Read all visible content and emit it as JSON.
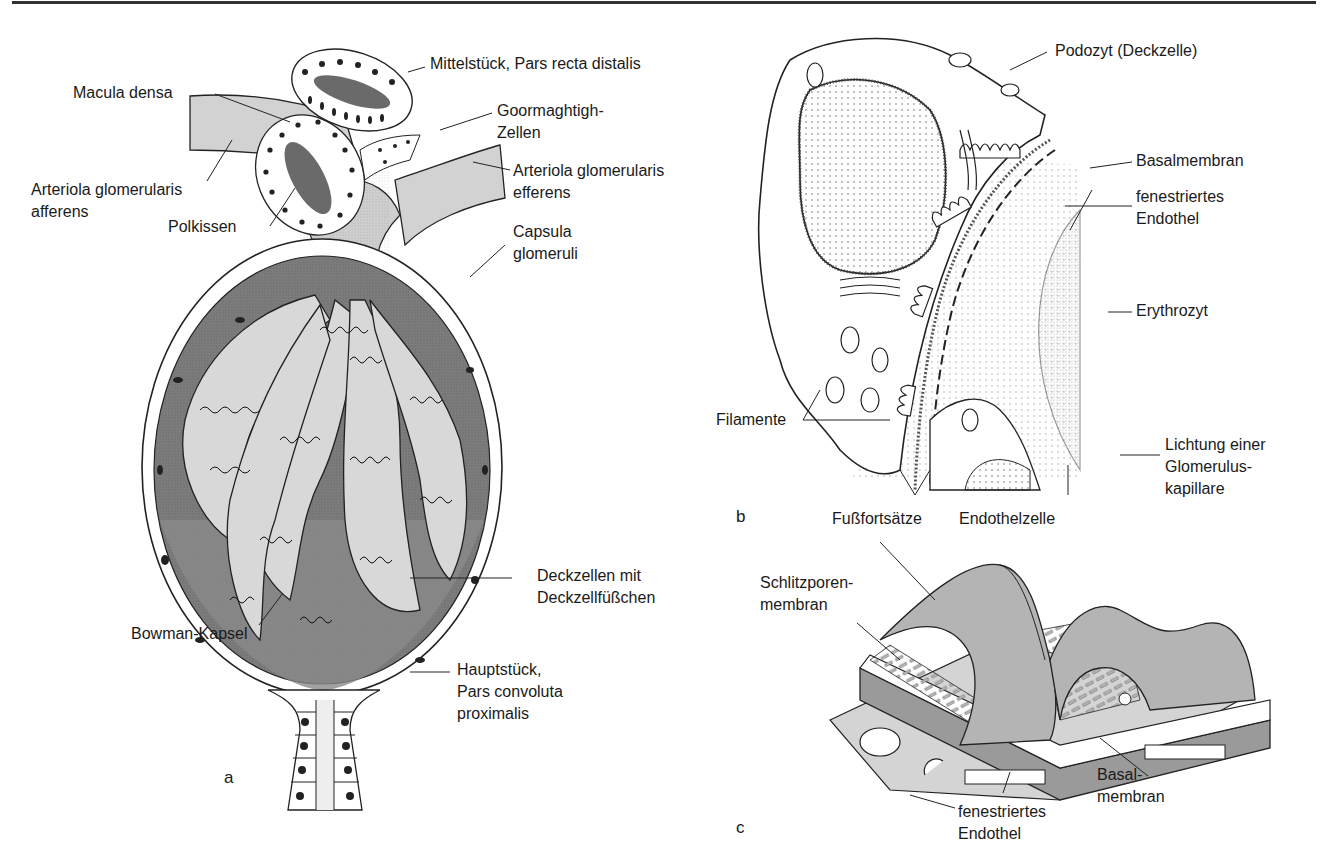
{
  "figure": {
    "panels": [
      {
        "letter": "a",
        "description": "Nierenkörperchen (Glomerulus) mit juxtaglomerulärem Apparat",
        "labels": {
          "macula_densa": "Macula densa",
          "mittelstueck": "Mittelstück, Pars recta distalis",
          "goormaghtigh_1": "Goormaghtigh-",
          "goormaghtigh_2": "Zellen",
          "afferens_1": "Arteriola glomerularis",
          "afferens_2": "afferens",
          "efferens_1": "Arteriola glomerularis",
          "efferens_2": "efferens",
          "polkissen": "Polkissen",
          "capsula_1": "Capsula",
          "capsula_2": "glomeruli",
          "deckzellen_1": "Deckzellen mit",
          "deckzellen_2": "Deckzellfüßchen",
          "bowman": "Bowman-Kapsel",
          "hauptstueck_1": "Hauptstück,",
          "hauptstueck_2": "Pars convoluta",
          "hauptstueck_3": "proximalis"
        }
      },
      {
        "letter": "b",
        "description": "Podozyt und Glomeruluskapillare",
        "labels": {
          "podozyt": "Podozyt (Deckzelle)",
          "basalmembran": "Basalmembran",
          "fenestriert_1": "fenestriertes",
          "fenestriert_2": "Endothel",
          "erythrozyt": "Erythrozyt",
          "filamente": "Filamente",
          "lichtung_1": "Lichtung einer",
          "lichtung_2": "Glomerulus-",
          "lichtung_3": "kapillare",
          "fussfortsaetze": "Fußfortsätze",
          "endothelzelle": "Endothelzelle"
        }
      },
      {
        "letter": "c",
        "description": "Filtrationsbarriere (schematisch)",
        "labels": {
          "schlitz_1": "Schlitzporen-",
          "schlitz_2": "membran",
          "basal_1": "Basal-",
          "basal_2": "membran",
          "fenestriert_1": "fenestriertes",
          "fenestriert_2": "Endothel"
        }
      }
    ],
    "colors": {
      "line": "#1a1a1a",
      "light_gray": "#d4d4d4",
      "mid_gray": "#a8a8a8",
      "dark_gray": "#6e6e6e",
      "paper": "#ffffff"
    }
  }
}
